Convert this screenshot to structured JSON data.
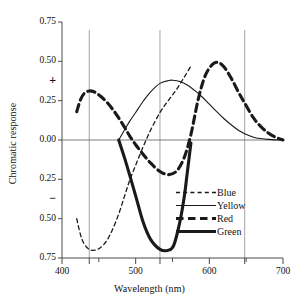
{
  "chart_data": {
    "type": "line",
    "title": "",
    "xlabel": "Wavelength (nm)",
    "ylabel": "Chromatic response",
    "xlim": [
      400,
      700
    ],
    "ylim": [
      -0.75,
      0.75
    ],
    "xticks": [
      400,
      500,
      600,
      700
    ],
    "xtick_labels": [
      "400",
      "500",
      "600",
      "700"
    ],
    "yticks": [
      0.75,
      0.5,
      0.25,
      0.0,
      -0.25,
      -0.5,
      -0.75
    ],
    "ytick_labels": [
      "0.75",
      "0.50",
      "0.25",
      "0.00",
      "0.25",
      "0.50",
      "0.75"
    ],
    "positive_sign": "+",
    "negative_sign": "−",
    "grid": true,
    "gridlines_x": [
      437,
      533,
      648
    ],
    "zero_line": 0.0,
    "legend_position": "lower-right",
    "series": [
      {
        "name": "Blue",
        "style": "thin-dashed",
        "color": "#1a1a1a",
        "x": [
          420,
          425,
          430,
          437,
          445,
          452,
          460,
          468,
          477,
          485,
          492,
          500,
          510,
          520,
          533,
          545,
          556,
          566,
          575
        ],
        "y": [
          -0.5,
          -0.6,
          -0.66,
          -0.695,
          -0.7,
          -0.685,
          -0.645,
          -0.575,
          -0.47,
          -0.355,
          -0.255,
          -0.16,
          -0.045,
          0.06,
          0.175,
          0.255,
          0.325,
          0.4,
          0.47
        ]
      },
      {
        "name": "Yellow",
        "style": "thin-solid",
        "color": "#1a1a1a",
        "x": [
          477,
          485,
          492,
          500,
          510,
          520,
          533,
          545,
          550,
          560,
          570,
          580,
          590,
          600,
          610,
          620,
          630,
          640,
          648,
          660,
          670,
          680,
          690,
          700
        ],
        "y": [
          0.0,
          0.065,
          0.12,
          0.175,
          0.245,
          0.305,
          0.36,
          0.378,
          0.38,
          0.372,
          0.35,
          0.315,
          0.275,
          0.228,
          0.18,
          0.135,
          0.095,
          0.06,
          0.04,
          0.018,
          0.009,
          0.004,
          0.001,
          0.0
        ]
      },
      {
        "name": "Red",
        "style": "thick-dashed",
        "color": "#1a1a1a",
        "x": [
          420,
          425,
          430,
          437,
          444,
          452,
          460,
          468,
          477,
          485,
          492,
          500,
          510,
          520,
          533,
          545,
          556,
          566,
          575,
          585,
          595,
          607,
          618,
          630,
          640,
          648,
          660,
          670,
          680,
          690,
          700
        ],
        "y": [
          0.18,
          0.255,
          0.295,
          0.312,
          0.305,
          0.28,
          0.245,
          0.2,
          0.14,
          0.08,
          0.025,
          -0.03,
          -0.09,
          -0.145,
          -0.2,
          -0.22,
          -0.195,
          -0.11,
          0.035,
          0.26,
          0.415,
          0.49,
          0.475,
          0.39,
          0.3,
          0.235,
          0.14,
          0.085,
          0.045,
          0.018,
          0.0
        ]
      },
      {
        "name": "Green",
        "style": "thick-solid",
        "color": "#1a1a1a",
        "x": [
          477,
          485,
          492,
          500,
          510,
          520,
          533,
          545,
          552,
          560,
          566,
          570,
          575
        ],
        "y": [
          0.0,
          -0.115,
          -0.225,
          -0.355,
          -0.52,
          -0.63,
          -0.695,
          -0.7,
          -0.665,
          -0.52,
          -0.36,
          -0.21,
          -0.02
        ]
      }
    ]
  },
  "legend": {
    "items": [
      {
        "label": "Blue",
        "style": "thin-dashed"
      },
      {
        "label": "Yellow",
        "style": "thin-solid"
      },
      {
        "label": "Red",
        "style": "thick-dashed"
      },
      {
        "label": "Green",
        "style": "thick-solid"
      }
    ]
  }
}
